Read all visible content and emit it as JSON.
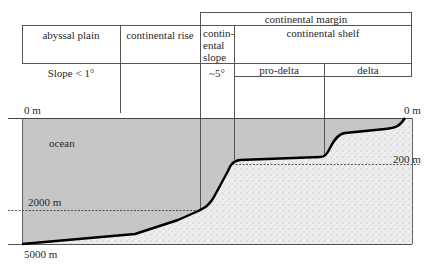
{
  "diagram": {
    "header": {
      "continental_margin": "continental margin",
      "abyssal_plain": "abyssal plain",
      "continental_rise": "continental rise",
      "continental_slope": [
        "contin-",
        "ental",
        "slope"
      ],
      "continental_shelf": "continental shelf",
      "pro_delta": "pro-delta",
      "delta": "delta"
    },
    "slopes": {
      "abyssal_plain": "Slope < 1°",
      "continental_slope": "~5°"
    },
    "depths": {
      "left_top": "0 m",
      "right_top": "0 m",
      "d200": "200 m",
      "d2000": "2000 m",
      "d5000": "5000 m"
    },
    "regions": {
      "ocean": "ocean"
    },
    "colors": {
      "ocean_fill": "#c6c6c6",
      "sediment_fill": "#ececec",
      "seafloor_line": "#000000",
      "grid_line": "#555555"
    }
  }
}
